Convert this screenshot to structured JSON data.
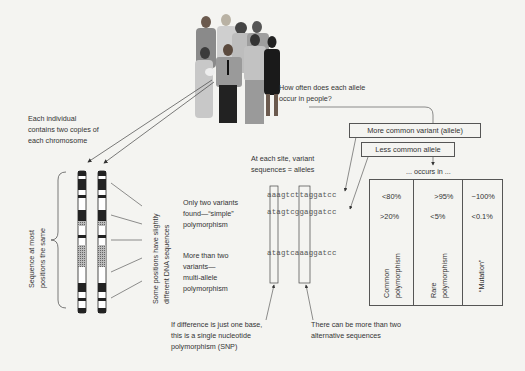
{
  "people": {
    "label": "group-of-people-illustration"
  },
  "question": {
    "line1": "How often does each allele",
    "line2": "occur in people?"
  },
  "individual": {
    "line1": "Each individual",
    "line2": "contains two copies of",
    "line3": "each chromosome"
  },
  "brace_label": {
    "line1": "Sequence at most",
    "line2": "positions the same"
  },
  "differences_label": {
    "line1": "Some positions have slightly",
    "line2": "different DNA sequences"
  },
  "site_label": {
    "line1": "At each site, variant",
    "line2": "sequences = alleles"
  },
  "simple": {
    "line1": "Only two variants",
    "line2": "found—“simple”",
    "line3": "polymorphism"
  },
  "multi": {
    "line1": "More than two",
    "line2": "variants—",
    "line3": "multi-allele",
    "line4": "polymorphism"
  },
  "sequences": [
    "aaagtcttaggatcc",
    "atagtcggaggatcc",
    "atagtcaaaggatcc"
  ],
  "snp_note": {
    "line1": "If difference is just one base,",
    "line2": "this is a single nucleotide",
    "line3": "polymorphism (SNP)"
  },
  "alt_note": {
    "line1": "There can be more than two",
    "line2": "alternative sequences"
  },
  "more_common_box": "More common variant (allele)",
  "less_common_box": "Less common allele",
  "occurs_in": "... occurs in ...",
  "table": {
    "columns": [
      {
        "more": "<80%",
        "less": ">20%",
        "label1": "Common",
        "label2": "polymorphism"
      },
      {
        "more": ">95%",
        "less": "<5%",
        "label1": "Rare",
        "label2": "polymorphism"
      },
      {
        "more": "~100%",
        "less": "<0.1%",
        "label1": "“Mutation”",
        "label2": ""
      }
    ]
  },
  "colors": {
    "background": "#f4f4f1",
    "line": "#555555",
    "text": "#333333"
  }
}
